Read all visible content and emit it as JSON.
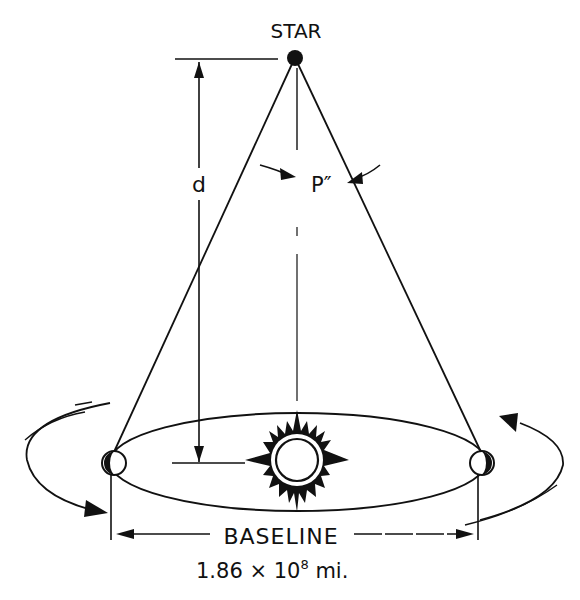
{
  "diagram": {
    "labels": {
      "star": "STAR",
      "distance": "d",
      "parallax_angle": "P″",
      "baseline": "BASELINE",
      "baseline_value_mantissa": "1.86 × 10",
      "baseline_value_exponent": "8",
      "baseline_value_unit": " mi."
    },
    "elements": {
      "star": "star-point",
      "sun": "sun-icon",
      "earth_left": "earth-icon",
      "earth_right": "earth-icon",
      "orbit": "earth-orbit-ellipse"
    },
    "colors": {
      "ink": "#111111",
      "background": "#ffffff"
    }
  }
}
